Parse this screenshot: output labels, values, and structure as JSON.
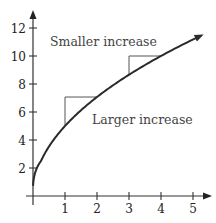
{
  "chart_data": {
    "type": "line",
    "title": "",
    "xlabel": "",
    "ylabel": "",
    "function": "y = 5*sqrt(x)",
    "x": [
      0,
      0.25,
      0.5,
      1,
      1.5,
      2,
      2.5,
      3,
      3.5,
      4,
      4.5,
      5,
      5.25
    ],
    "series": [
      {
        "name": "curve",
        "values": [
          0,
          2.5,
          3.54,
          5,
          6.12,
          7.07,
          7.91,
          8.66,
          9.35,
          10,
          10.61,
          11.18,
          11.46
        ]
      }
    ],
    "xlim": [
      0,
      5.3
    ],
    "ylim": [
      0,
      12.5
    ],
    "x_ticks": [
      1,
      2,
      3,
      4,
      5
    ],
    "y_ticks": [
      2,
      4,
      6,
      8,
      10,
      12
    ],
    "x_tick_labels": [
      "1",
      "2",
      "3",
      "4",
      "5"
    ],
    "y_tick_labels": [
      "2",
      "4",
      "6",
      "8",
      "10",
      "12"
    ],
    "grid": false,
    "legend": null,
    "annotations": [
      {
        "text": "Smaller increase",
        "triangle": {
          "x0": 3,
          "x1": 4,
          "y0": 8.66,
          "y1": 10
        }
      },
      {
        "text": "Larger increase",
        "triangle": {
          "x0": 1,
          "x1": 2,
          "y0": 5,
          "y1": 7.07
        }
      }
    ]
  }
}
